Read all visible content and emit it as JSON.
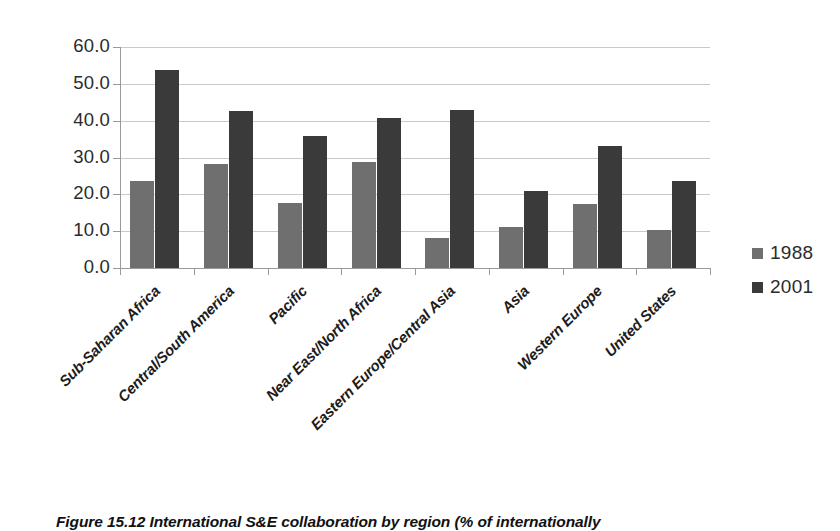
{
  "figure": {
    "caption": "Figure 15.12 International S&E collaboration by region (% of internationally"
  },
  "legend": {
    "position": "right",
    "items": [
      {
        "label": "1988",
        "color": "#6f6f6f",
        "swatch": "legend-swatch-1988"
      },
      {
        "label": "2001",
        "color": "#3a3a3a",
        "swatch": "legend-swatch-2001"
      }
    ]
  },
  "axes": {
    "y_ticks": [
      "60.0",
      "50.0",
      "40.0",
      "30.0",
      "20.0",
      "10.0",
      "0.0"
    ],
    "y_min": 0,
    "y_max": 60,
    "y_step": 10,
    "grid": true
  },
  "chart_data": {
    "type": "bar",
    "title": "",
    "subtitle": "",
    "xlabel": "",
    "ylabel": "",
    "ylim": [
      0,
      60
    ],
    "ytick_step": 10,
    "grid": true,
    "legend_position": "right",
    "categories": [
      "Sub-Saharan Africa",
      "Central/South America",
      "Pacific",
      "Near East/North Africa",
      "Eastern Europe/Central Asia",
      "Asia",
      "Western Europe",
      "United States"
    ],
    "series": [
      {
        "name": "1988",
        "color": "#6f6f6f",
        "values": [
          23.7,
          28.2,
          17.7,
          28.7,
          8.2,
          11.1,
          17.3,
          10.3
        ]
      },
      {
        "name": "2001",
        "color": "#3a3a3a",
        "values": [
          53.8,
          42.6,
          35.8,
          40.8,
          42.9,
          21.0,
          33.0,
          23.5
        ]
      }
    ]
  }
}
